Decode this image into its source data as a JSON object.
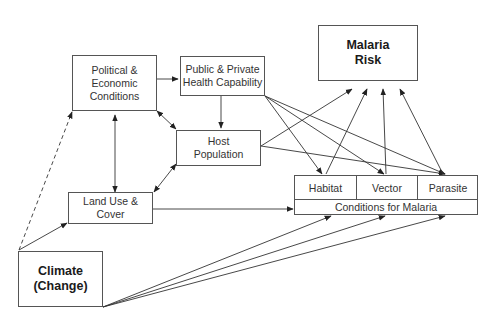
{
  "diagram": {
    "nodes": {
      "political": {
        "label": "Political &\nEconomic\nConditions"
      },
      "health": {
        "label": "Public & Private\nHealth Capability"
      },
      "malaria_risk": {
        "label": "Malaria\nRisk"
      },
      "host": {
        "label": "Host\nPopulation"
      },
      "land_use": {
        "label": "Land Use &\nCover"
      },
      "climate": {
        "label": "Climate\n(Change)"
      },
      "conditions": {
        "label": "Conditions for Malaria",
        "cells": [
          {
            "label": "Habitat"
          },
          {
            "label": "Vector"
          },
          {
            "label": "Parasite"
          }
        ]
      }
    },
    "edges": [
      {
        "from": "Political & Economic Conditions",
        "to": "Public & Private Health Capability",
        "style": "solid"
      },
      {
        "from": "Political & Economic Conditions",
        "to": "Land Use & Cover",
        "style": "solid",
        "bidirectional": true
      },
      {
        "from": "Political & Economic Conditions",
        "to": "Host Population",
        "style": "solid",
        "bidirectional": true
      },
      {
        "from": "Public & Private Health Capability",
        "to": "Host Population",
        "style": "solid"
      },
      {
        "from": "Host Population",
        "to": "Land Use & Cover",
        "style": "solid",
        "bidirectional": true
      },
      {
        "from": "Public & Private Health Capability",
        "to": "Habitat",
        "style": "solid"
      },
      {
        "from": "Public & Private Health Capability",
        "to": "Vector",
        "style": "solid"
      },
      {
        "from": "Public & Private Health Capability",
        "to": "Parasite",
        "style": "solid"
      },
      {
        "from": "Host Population",
        "to": "Malaria Risk",
        "style": "solid"
      },
      {
        "from": "Host Population",
        "to": "Parasite",
        "style": "solid"
      },
      {
        "from": "Habitat",
        "to": "Malaria Risk",
        "style": "solid"
      },
      {
        "from": "Vector",
        "to": "Malaria Risk",
        "style": "solid"
      },
      {
        "from": "Parasite",
        "to": "Malaria Risk",
        "style": "solid"
      },
      {
        "from": "Land Use & Cover",
        "to": "Conditions for Malaria",
        "style": "solid"
      },
      {
        "from": "Climate (Change)",
        "to": "Political & Economic Conditions",
        "style": "dashed"
      },
      {
        "from": "Climate (Change)",
        "to": "Land Use & Cover",
        "style": "solid"
      },
      {
        "from": "Climate (Change)",
        "to": "Habitat",
        "style": "solid"
      },
      {
        "from": "Climate (Change)",
        "to": "Vector",
        "style": "solid"
      },
      {
        "from": "Climate (Change)",
        "to": "Parasite",
        "style": "solid"
      }
    ]
  }
}
